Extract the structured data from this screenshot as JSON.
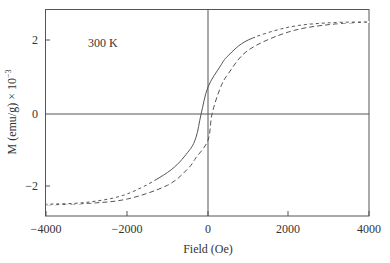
{
  "chart_data": {
    "type": "line",
    "title": "",
    "annotation": "300 K",
    "xlabel": "Field (Oe)",
    "ylabel": "M (emu/g) × 10⁻³",
    "xlim": [
      -4000,
      4000
    ],
    "ylim": [
      -2.8,
      2.85
    ],
    "xticks": [
      -4000,
      -2000,
      0,
      2000,
      4000
    ],
    "xtick_labels": [
      "-4000",
      "-2000",
      "0",
      "2000",
      "4000"
    ],
    "yticks": [
      -2,
      0,
      2
    ],
    "ytick_labels": [
      "-2",
      "0",
      "2"
    ],
    "grid": false,
    "zero_lines": true,
    "legend": null,
    "series": [
      {
        "name": "descending branch",
        "style": "solid near center, dashed at high field",
        "x": [
          -4000,
          -3000,
          -2000,
          -1000,
          -500,
          -300,
          -170,
          0,
          300,
          500,
          1000,
          2000,
          3000,
          4000
        ],
        "y": [
          -2.47,
          -2.42,
          -2.19,
          -1.6,
          -1.05,
          -0.65,
          0.0,
          0.74,
          1.3,
          1.6,
          2.03,
          2.38,
          2.5,
          2.52
        ]
      },
      {
        "name": "ascending branch",
        "style": "dashed",
        "x": [
          -4000,
          -3000,
          -2000,
          -1000,
          -500,
          -300,
          0,
          100,
          300,
          500,
          1000,
          2000,
          3000,
          4000
        ],
        "y": [
          -2.49,
          -2.45,
          -2.33,
          -1.95,
          -1.5,
          -1.2,
          -0.72,
          0.0,
          0.7,
          1.1,
          1.75,
          2.25,
          2.45,
          2.52
        ]
      }
    ]
  },
  "labels": {
    "annotation": "300 K",
    "xlabel": "Field (Oe)",
    "ylabel": "M (emu/g) × 10",
    "ylabel_exp": "−3",
    "xticks": [
      "−4000",
      "−2000",
      "0",
      "2000",
      "4000"
    ],
    "yticks": [
      "2",
      "0",
      "−2"
    ]
  }
}
